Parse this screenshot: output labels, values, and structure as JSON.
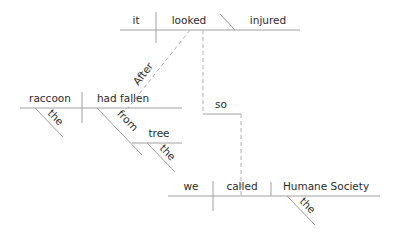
{
  "diagram": {
    "type": "sentence-diagram",
    "colors": {
      "line": "#a0a0a0",
      "dashed_line": "#b0b0b0",
      "text": "#2b2b2b",
      "background": "#ffffff"
    },
    "main_clause": {
      "subject": "it",
      "verb": "looked",
      "predicate_adjective": "injured"
    },
    "subordinate_clause": {
      "conjunction": "After",
      "subject": "raccoon",
      "subject_modifier": "the",
      "verb": "had fallen",
      "preposition": "from",
      "prep_object": "tree",
      "prep_object_modifier": "the"
    },
    "coordinating_conjunction": "so",
    "second_clause": {
      "subject": "we",
      "verb": "called",
      "direct_object": "Humane Society",
      "object_modifier": "the"
    }
  }
}
